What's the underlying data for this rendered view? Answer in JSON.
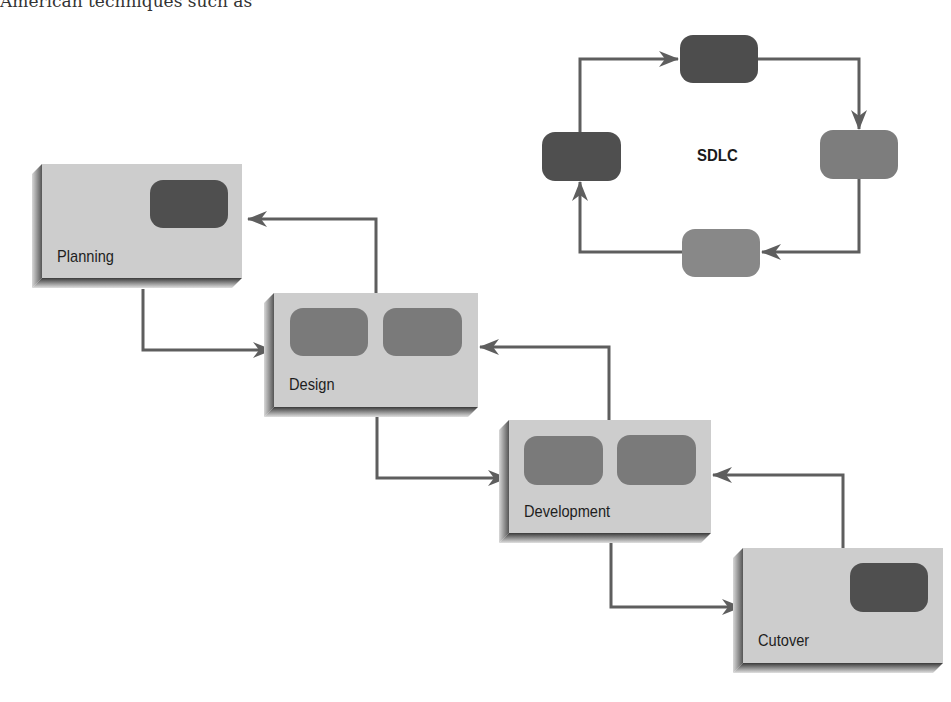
{
  "page_text": {
    "cropped_line_dark": "American techniques such as",
    "cropped_line_faded": "         "
  },
  "diagram": {
    "type": "waterfall-with-cycle",
    "cycle": {
      "title": "SDLC",
      "nodes": [
        {
          "position": "top",
          "shade": "dark",
          "color": "#4d4d4d"
        },
        {
          "position": "right",
          "shade": "medium",
          "color": "#7d7d7d"
        },
        {
          "position": "bottom",
          "shade": "light",
          "color": "#888888"
        },
        {
          "position": "left",
          "shade": "dark",
          "color": "#4f4f4f"
        }
      ],
      "flow": [
        "left -> top",
        "top -> right",
        "right -> bottom",
        "bottom -> left"
      ]
    },
    "phases": [
      {
        "label": "Planning",
        "inner_blocks": [
          {
            "shade": "dark",
            "color": "#4f4f4f"
          }
        ]
      },
      {
        "label": "Design",
        "inner_blocks": [
          {
            "shade": "medium",
            "color": "#7a7a7a"
          },
          {
            "shade": "medium",
            "color": "#7a7a7a"
          }
        ]
      },
      {
        "label": "Development",
        "inner_blocks": [
          {
            "shade": "medium",
            "color": "#7a7a7a"
          },
          {
            "shade": "medium",
            "color": "#7a7a7a"
          }
        ]
      },
      {
        "label": "Cutover",
        "inner_blocks": [
          {
            "shade": "dark",
            "color": "#4f4f4f"
          }
        ]
      }
    ],
    "connections": [
      {
        "from": "Planning",
        "to": "Design",
        "direction": "forward"
      },
      {
        "from": "Design",
        "to": "Planning",
        "direction": "feedback"
      },
      {
        "from": "Design",
        "to": "Development",
        "direction": "forward"
      },
      {
        "from": "Development",
        "to": "Design",
        "direction": "feedback"
      },
      {
        "from": "Development",
        "to": "Cutover",
        "direction": "forward"
      },
      {
        "from": "Cutover",
        "to": "Development",
        "direction": "feedback"
      }
    ],
    "colors": {
      "box_face": "#cdcdcd",
      "box_side": "#6a6a6a",
      "arrow": "#5e5e5e"
    }
  }
}
